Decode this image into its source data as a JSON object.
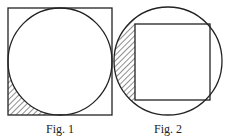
{
  "figures": [
    {
      "caption": "Fig. 1",
      "description": "Circle inscribed in a square; bottom-left corner region between square and circle is hatched",
      "square": {
        "x": 8,
        "y": 8,
        "w": 104,
        "h": 107
      },
      "circle": {
        "cx": 60,
        "cy": 61.5,
        "r": 52
      },
      "shaded_region": "bottom-left corner"
    },
    {
      "caption": "Fig. 2",
      "description": "Square inscribed in a circle; left circular segment between circle and square is hatched",
      "circle": {
        "cx": 168,
        "cy": 61,
        "r": 54
      },
      "square": {
        "x": 135,
        "y": 24,
        "w": 75,
        "h": 76
      },
      "shaded_region": "left segment"
    }
  ],
  "colors": {
    "stroke": "#222222",
    "background": "#ffffff"
  }
}
